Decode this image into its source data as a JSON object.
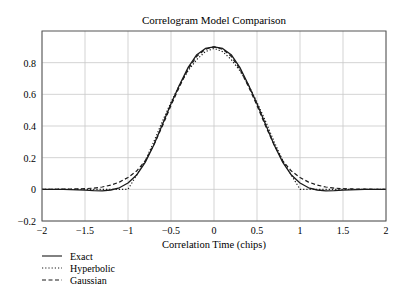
{
  "chart_data": {
    "type": "line",
    "title": "Correlogram Model Comparison",
    "xlabel": "Correlation Time (chips)",
    "ylabel": "",
    "xlim": [
      -2,
      2
    ],
    "ylim": [
      -0.2,
      1.0
    ],
    "xticks": [
      -2,
      -1.5,
      -1,
      -0.5,
      0,
      0.5,
      1,
      1.5,
      2
    ],
    "xtick_labels": [
      "−2",
      "−1.5",
      "−1",
      "−0.5",
      "0",
      "0.5",
      "1",
      "1.5",
      "2"
    ],
    "yticks": [
      -0.2,
      0,
      0.2,
      0.4,
      0.6,
      0.8
    ],
    "ytick_labels": [
      "−0.2",
      "0",
      "0.2",
      "0.4",
      "0.6",
      "0.8"
    ],
    "grid": true,
    "legend_position": "below-left",
    "x": [
      -2,
      -1.75,
      -1.5,
      -1.4,
      -1.3,
      -1.2,
      -1.1,
      -1.0,
      -0.9,
      -0.8,
      -0.7,
      -0.6,
      -0.5,
      -0.4,
      -0.3,
      -0.2,
      -0.1,
      0,
      0.1,
      0.2,
      0.3,
      0.4,
      0.5,
      0.6,
      0.7,
      0.8,
      0.9,
      1.0,
      1.1,
      1.2,
      1.3,
      1.4,
      1.5,
      1.75,
      2
    ],
    "series": [
      {
        "name": "Exact",
        "style": "solid",
        "values": [
          0,
          0,
          -0.005,
          -0.008,
          -0.009,
          -0.004,
          0.01,
          0.04,
          0.09,
          0.17,
          0.28,
          0.41,
          0.54,
          0.66,
          0.77,
          0.85,
          0.89,
          0.9,
          0.89,
          0.85,
          0.77,
          0.66,
          0.54,
          0.41,
          0.28,
          0.17,
          0.09,
          0.04,
          0.01,
          -0.004,
          -0.009,
          -0.008,
          -0.005,
          0,
          0
        ]
      },
      {
        "name": "Hyperbolic",
        "style": "dotted",
        "values": [
          0,
          0,
          0,
          0,
          0,
          0,
          0,
          0,
          0.09,
          0.18,
          0.3,
          0.43,
          0.55,
          0.66,
          0.75,
          0.82,
          0.87,
          0.89,
          0.87,
          0.82,
          0.75,
          0.66,
          0.55,
          0.43,
          0.3,
          0.18,
          0.09,
          0,
          0,
          0,
          0,
          0,
          0,
          0,
          0
        ]
      },
      {
        "name": "Gaussian",
        "style": "dashed",
        "values": [
          0,
          0.001,
          0.004,
          0.008,
          0.015,
          0.027,
          0.046,
          0.075,
          0.115,
          0.18,
          0.28,
          0.4,
          0.53,
          0.65,
          0.76,
          0.84,
          0.885,
          0.9,
          0.885,
          0.84,
          0.76,
          0.65,
          0.53,
          0.4,
          0.28,
          0.18,
          0.115,
          0.075,
          0.046,
          0.027,
          0.015,
          0.008,
          0.004,
          0.001,
          0
        ]
      }
    ]
  },
  "legend": [
    {
      "label": "Exact",
      "style": "solid"
    },
    {
      "label": "Hyperbolic",
      "style": "dotted"
    },
    {
      "label": "Gaussian",
      "style": "dashed"
    }
  ],
  "colors": {
    "line": "#1a1a1a",
    "grid": "#c8c8c8",
    "frame": "#555555"
  }
}
